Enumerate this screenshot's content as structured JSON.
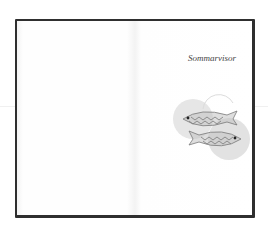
{
  "scene": {
    "description": "Open hardcover book lying flat, dark cover edges, blank left page, right page with title and fish illustration",
    "colors": {
      "background": "#ffffff",
      "cover": "#2f2f2f",
      "page": "#fdfdfd",
      "circle": "#e4e4e4",
      "fish": "#777777"
    }
  },
  "book": {
    "right_page": {
      "title": "Sommarvisor",
      "illustration": "two-fish-with-circles"
    }
  }
}
